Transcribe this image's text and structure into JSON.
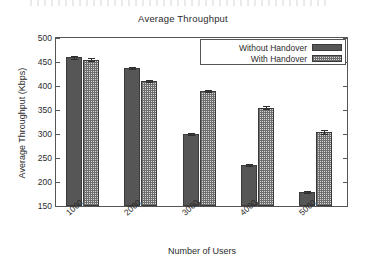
{
  "chart_data": {
    "type": "bar",
    "title": "Average Throughput",
    "xlabel": "Number of Users",
    "ylabel": "Average Throughput (Kbps)",
    "categories": [
      "1000",
      "2000",
      "3000",
      "4000",
      "5000"
    ],
    "series": [
      {
        "name": "Without Handover",
        "fill": "solid",
        "color": "#565656",
        "values": [
          460,
          437,
          300,
          236,
          180
        ],
        "errors": [
          3,
          2,
          2,
          2,
          2
        ]
      },
      {
        "name": "With Handover",
        "fill": "checker",
        "color": "#d8d8d8",
        "values": [
          455,
          411,
          390,
          355,
          305
        ],
        "errors": [
          3,
          2,
          2,
          3,
          4
        ]
      }
    ],
    "ylim": [
      150,
      500
    ],
    "yticks": [
      500,
      450,
      400,
      350,
      300,
      250,
      200,
      150
    ],
    "ytick_labels": [
      "500",
      "450",
      "400",
      "350",
      "300",
      "250",
      "200",
      "150"
    ],
    "grid": false,
    "legend_position": "top-right",
    "xtick_rotation": -42
  },
  "legend": {
    "entries": [
      {
        "label": "Without Handover"
      },
      {
        "label": "With Handover"
      }
    ]
  }
}
